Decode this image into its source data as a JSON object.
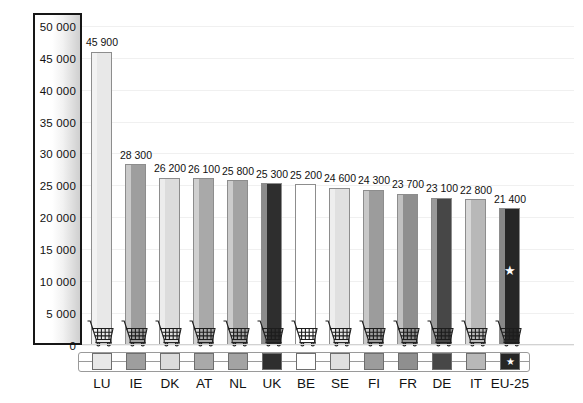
{
  "chart_data": {
    "type": "bar",
    "title": "",
    "subtitle": "",
    "xlabel": "",
    "ylabel": "",
    "ylim": [
      0,
      52000
    ],
    "grid": true,
    "legend_position": "bottom",
    "categories": [
      "LU",
      "IE",
      "DK",
      "AT",
      "NL",
      "UK",
      "BE",
      "SE",
      "FI",
      "FR",
      "DE",
      "IT",
      "EU-25"
    ],
    "values": [
      45900,
      28300,
      26200,
      26100,
      25800,
      25300,
      25200,
      24600,
      24300,
      23700,
      23100,
      22800,
      21400
    ],
    "value_labels": [
      "45 900",
      "28 300",
      "26 200",
      "26 100",
      "25 800",
      "25 300",
      "25 200",
      "24 600",
      "24 300",
      "23 700",
      "23 100",
      "22 800",
      "21 400"
    ],
    "bar_colors": [
      "#e8e8e8",
      "#9e9e9e",
      "#dcdcdc",
      "#a9a9a9",
      "#a3a3a3",
      "#2e2e2e",
      "#ffffff",
      "#e0e0e0",
      "#9c9c9c",
      "#8f8f8f",
      "#474747",
      "#b8b8b8",
      "#262626"
    ],
    "tick_labels": [
      "50 000",
      "45 000",
      "40 000",
      "35 000",
      "30 000",
      "25 000",
      "20 000",
      "15 000",
      "10 000",
      "5 000",
      "0"
    ],
    "tick_values": [
      50000,
      45000,
      40000,
      35000,
      30000,
      25000,
      20000,
      15000,
      10000,
      5000,
      0
    ],
    "annotations": [
      {
        "category": "EU-25",
        "marker": "star",
        "description": "star marker on EU-25 bar"
      }
    ],
    "icons": {
      "bar_base": "shopping-cart-icon",
      "eu_marker": "star-icon"
    }
  },
  "star_glyph": "★"
}
